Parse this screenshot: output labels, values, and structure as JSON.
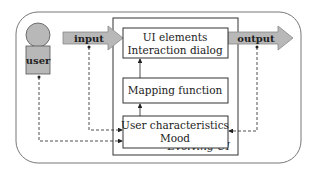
{
  "diagram": {
    "actor": {
      "label": "user"
    },
    "input_arrow": {
      "label": "input"
    },
    "output_arrow": {
      "label": "output"
    },
    "container": {
      "label": "Evolving UI"
    },
    "boxes": [
      {
        "id": "ui-elements",
        "lines": [
          "UI elements",
          "Interaction dialog"
        ]
      },
      {
        "id": "mapping",
        "lines": [
          "Mapping function"
        ]
      },
      {
        "id": "user-char",
        "lines": [
          "User characteristics",
          "Mood"
        ]
      }
    ],
    "colors": {
      "fill_gray": "#b8b8b8",
      "stroke": "#333333",
      "outer_stroke": "#777777"
    }
  }
}
